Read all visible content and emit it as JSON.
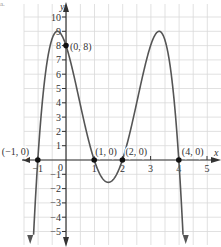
{
  "corner_label": "a.",
  "chart_data": {
    "type": "line",
    "title": "",
    "xlabel": "x",
    "ylabel": "y",
    "function": "y = -(x+1)(x-1)(x-2)(x-4)",
    "xlim": [
      -1.5,
      5.5
    ],
    "ylim": [
      -6,
      11
    ],
    "grid": true,
    "x_ticks": [
      -1,
      0,
      1,
      2,
      3,
      4,
      5
    ],
    "x_tick_labels": [
      "-1",
      "0",
      "1",
      "2",
      "3",
      "4",
      "5"
    ],
    "y_ticks": [
      -5,
      -4,
      -3,
      -2,
      -1,
      1,
      2,
      3,
      4,
      5,
      6,
      7,
      8,
      9,
      10
    ],
    "y_tick_labels": [
      "-5",
      "-4",
      "-3",
      "-2",
      "-1",
      "1",
      "2",
      "3",
      "4",
      "5",
      "6",
      "7",
      "8",
      "9",
      "10"
    ],
    "labeled_points": [
      {
        "x": -1,
        "y": 0,
        "label": "(-1, 0)"
      },
      {
        "x": 0,
        "y": 8,
        "label": "(0, 8)"
      },
      {
        "x": 1,
        "y": 0,
        "label": "(1, 0)"
      },
      {
        "x": 2,
        "y": 0,
        "label": "(2, 0)"
      },
      {
        "x": 4,
        "y": 0,
        "label": "(4, 0)"
      }
    ],
    "curve_color": "#555555",
    "axis_color": "#333333",
    "grid_color": "#d9d9d9",
    "point_color": "#111111"
  }
}
